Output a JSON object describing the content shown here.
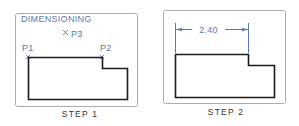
{
  "colors": {
    "frame": "#a8acb8",
    "annotation": "#5b78ad",
    "geometry": "#1a1a1a",
    "caption": "#333333"
  },
  "step1": {
    "caption": "STEP 1",
    "title": "DIMENSIONING",
    "points": [
      {
        "label": "P1",
        "marker": "x-mark"
      },
      {
        "label": "P2",
        "marker": "x-mark"
      },
      {
        "label": "P3",
        "marker": "x-mark"
      }
    ]
  },
  "step2": {
    "caption": "STEP 2",
    "dimension_value": "2.40"
  }
}
